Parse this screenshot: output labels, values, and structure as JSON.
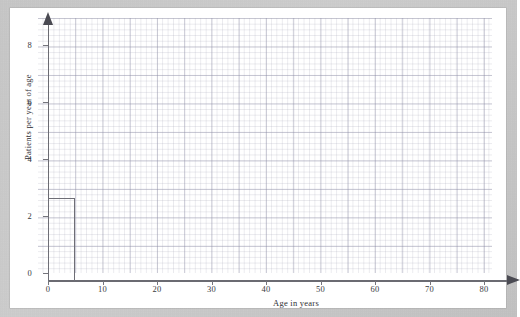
{
  "figure": {
    "background_color": "#ffffff",
    "scan_border_color": "#c9c9c9",
    "axis_color": "#6b6b72",
    "grid_minor_color": "#d3d3dd",
    "grid_major_color": "#b6b6c6",
    "bar_outline_color": "#6e6e76"
  },
  "chart_data": {
    "type": "bar",
    "title": "",
    "subtitle": "",
    "xlabel": "Age in years",
    "ylabel": "Patients per year of age",
    "xlim": [
      0,
      83.3
    ],
    "ylim": [
      0,
      9.2
    ],
    "xticks": [
      0,
      10,
      20,
      30,
      40,
      50,
      60,
      70,
      80
    ],
    "xtick_labels": [
      "0",
      "10",
      "20",
      "30",
      "40",
      "50",
      "60",
      "70",
      "80"
    ],
    "yticks": [
      0,
      2,
      4,
      6,
      8
    ],
    "ytick_labels": [
      "0",
      "2",
      "4",
      "6",
      "8"
    ],
    "grid": true,
    "grid_major_step_x": 10,
    "grid_major_step_y": 1,
    "grid_minor_step_x": 2,
    "grid_minor_step_y": 0.2,
    "legend": null,
    "bin_edges": [
      0,
      5
    ],
    "categories": [
      "0-5"
    ],
    "values": [
      2.9
    ],
    "bars": [
      {
        "x_start": 0,
        "x_end": 5,
        "height": 2.9,
        "filled": false
      }
    ],
    "annotations": []
  },
  "axes": {
    "x_arrow": "arrow-right",
    "y_arrow": "arrow-up"
  }
}
